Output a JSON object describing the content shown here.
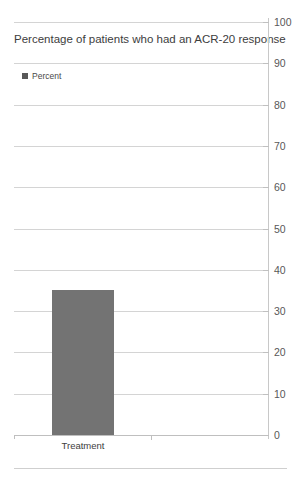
{
  "chart_data": {
    "type": "bar",
    "title": "Percentage of patients who had an ACR-20 response",
    "xlabel": "",
    "ylabel": "",
    "categories": [
      "Treatment"
    ],
    "series": [
      {
        "name": "Percent",
        "values": [
          35
        ]
      }
    ],
    "values": [
      35
    ],
    "ylim": [
      0,
      100
    ],
    "ytick_step": 10,
    "yticks": [
      100,
      90,
      80,
      70,
      60,
      50,
      40,
      30,
      20,
      10,
      0
    ],
    "ytick_labels": [
      "100",
      "90",
      "80",
      "70",
      "60",
      "50",
      "40",
      "30",
      "20",
      "10",
      "0"
    ],
    "grid": true,
    "grid_axis": "y",
    "axis_position": "right",
    "legend": {
      "position": "top-left",
      "entries": [
        {
          "label": "Percent",
          "color": "#737373",
          "marker": "square"
        }
      ]
    },
    "colors": {
      "bar": "#737373",
      "legend_swatch": "#595959",
      "gridline": "#d4d4d4",
      "axis": "#c0c0c0",
      "text": "#404040",
      "background": "#ffffff"
    }
  }
}
